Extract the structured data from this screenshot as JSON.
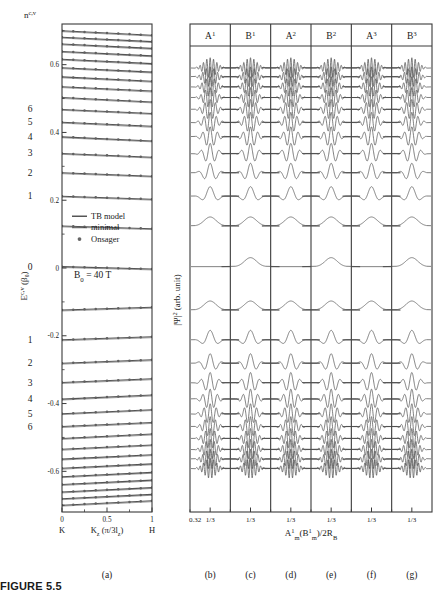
{
  "figure": {
    "caption_label": "FIGURE",
    "caption_number": "5.5"
  },
  "panel_a": {
    "label": "(a)",
    "ylabel": "E",
    "ylabel_sup": "c,v",
    "ylabel_unit": "(β₀)",
    "xlabel": "K",
    "xlabel_sub": "z",
    "xlabel_unit": "(π/3l",
    "xlabel_unit_sub": "z",
    "xlabel_unit_end": ")",
    "x_left_point": "K",
    "x_right_point": "H",
    "annotation": "B₀ = 40 T",
    "quantum_number_label": "n",
    "quantum_number_sup": "c,v",
    "x_ticks": [
      "0",
      "0.5",
      "1"
    ],
    "x_tick_values": [
      0,
      0.5,
      1
    ],
    "y_ticks": [
      "0.6",
      "0.4",
      "0.2",
      "0",
      "-0.2",
      "-0.4",
      "-0.6"
    ],
    "y_tick_values": [
      0.6,
      0.4,
      0.2,
      0,
      -0.2,
      -0.4,
      -0.6
    ],
    "ylim": [
      -0.72,
      0.72
    ],
    "n_labels_upper": [
      "6",
      "5",
      "4",
      "3",
      "2",
      "1",
      "0"
    ],
    "n_labels_lower": [
      "1",
      "2",
      "3",
      "4",
      "5",
      "6"
    ],
    "legend": [
      {
        "name": "TB model",
        "style": "thick-line",
        "color": "#555555"
      },
      {
        "name": "minimal",
        "style": "thin-line",
        "color": "#333333"
      },
      {
        "name": "Onsager",
        "style": "dot",
        "color": "#666666"
      }
    ],
    "bands": {
      "comment": "Landau-level energies (beta0) at K; each band disperses slightly downward toward H",
      "energy_at_K": [
        0.7,
        0.681,
        0.661,
        0.639,
        0.616,
        0.591,
        0.564,
        0.535,
        0.503,
        0.468,
        0.43,
        0.387,
        0.338,
        0.281,
        0.212,
        0.124,
        0.004,
        -0.124,
        -0.212,
        -0.281,
        -0.338,
        -0.387,
        -0.43,
        -0.468,
        -0.503,
        -0.535,
        -0.564,
        -0.591,
        -0.616,
        -0.639,
        -0.661,
        -0.681,
        -0.7
      ],
      "dispersion": [
        -0.013,
        -0.013,
        -0.013,
        -0.013,
        -0.013,
        -0.013,
        -0.013,
        -0.013,
        -0.013,
        -0.012,
        -0.012,
        -0.012,
        -0.011,
        -0.01,
        -0.009,
        -0.008,
        -0.007,
        0.008,
        0.009,
        0.01,
        0.011,
        0.012,
        0.012,
        0.012,
        0.013,
        0.013,
        0.013,
        0.013,
        0.013,
        0.013,
        0.013,
        0.013,
        0.013
      ],
      "n_index_map_upper": {
        "1": 0.212,
        "2": 0.281,
        "3": 0.338,
        "4": 0.387,
        "5": 0.43,
        "6": 0.468,
        "0": 0.004
      },
      "n_index_map_lower": {
        "1": -0.212,
        "2": -0.281,
        "3": -0.338,
        "4": -0.387,
        "5": -0.43,
        "6": -0.468
      },
      "onsager_dots_per_band": 9
    }
  },
  "panel_wave": {
    "ylabel": "|Ψ|",
    "ylabel_sup": "2",
    "ylabel_unit": "(arb. unit)",
    "xlabel": "A",
    "xlabel_sub": "m",
    "xlabel_sup": "1",
    "xlabel_rest": "(B",
    "xlabel_rest_sub": "m",
    "xlabel_rest_sup": "1",
    "xlabel_tail": ")/2R",
    "xlabel_tail_sub": "B",
    "columns": [
      {
        "header": "A",
        "sup": "1",
        "sublabel": "(b)",
        "kind": "A"
      },
      {
        "header": "B",
        "sup": "1",
        "sublabel": "(c)",
        "kind": "B"
      },
      {
        "header": "A",
        "sup": "2",
        "sublabel": "(d)",
        "kind": "A"
      },
      {
        "header": "B",
        "sup": "2",
        "sublabel": "(e)",
        "kind": "B"
      },
      {
        "header": "A",
        "sup": "3",
        "sublabel": "(f)",
        "kind": "A"
      },
      {
        "header": "B",
        "sup": "3",
        "sublabel": "(g)",
        "kind": "B"
      }
    ],
    "first_tick_label": "0.32",
    "tick_label": "1/3",
    "rows": {
      "comment": "Each row is one Landau level; 'nodes' = number of oscillation lobes in |Psi|^2 envelope",
      "upper_nodes": [
        11,
        10,
        9,
        8,
        7,
        6,
        5,
        4,
        3,
        2,
        1
      ],
      "zero_row_nodes": 1,
      "zero_row_only_B": true,
      "lower_nodes": [
        1,
        2,
        3,
        4,
        5,
        6,
        7,
        8,
        9,
        10,
        11
      ]
    }
  },
  "colors": {
    "axis": "#404040",
    "curve": "#4a4a4a",
    "band_thick": "#555555",
    "band_thin": "#2b2b2b",
    "dot": "#606060",
    "frame": "#3a3a3a"
  }
}
